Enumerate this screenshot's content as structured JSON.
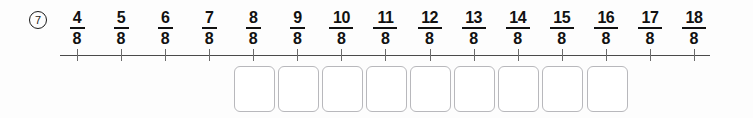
{
  "worksheet": {
    "problem_number": "7",
    "numberline": {
      "labels": [
        "4/8",
        "5/8",
        "6/8",
        "7/8",
        "8/8",
        "9/8",
        "10/8",
        "11/8",
        "12/8",
        "13/8",
        "14/8",
        "15/8",
        "16/8",
        "17/8",
        "18/8"
      ],
      "numerators": [
        "4",
        "5",
        "6",
        "7",
        "8",
        "9",
        "10",
        "11",
        "12",
        "13",
        "14",
        "15",
        "16",
        "17",
        "18"
      ],
      "denominators": [
        "8",
        "8",
        "8",
        "8",
        "8",
        "8",
        "8",
        "8",
        "8",
        "8",
        "8",
        "8",
        "8",
        "8",
        "8"
      ],
      "tick_count": 15,
      "line_color": "#4a4a4a",
      "tick_color": "#6b6b6b",
      "text_color": "#111111"
    },
    "answer_boxes": {
      "count": 9,
      "values": [
        "",
        "",
        "",
        "",
        "",
        "",
        "",
        "",
        ""
      ],
      "border_color": "#b8b8bc",
      "fill_color": "#ffffff"
    },
    "background_color": "#fdfdfd"
  }
}
